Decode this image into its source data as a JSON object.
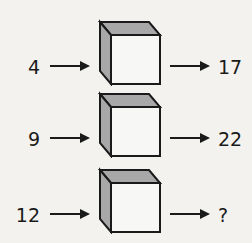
{
  "puzzle": {
    "rows": [
      {
        "input": "4",
        "output": "17"
      },
      {
        "input": "9",
        "output": "22"
      },
      {
        "input": "12",
        "output": "?"
      }
    ]
  },
  "colors": {
    "background": "#f3f2ef",
    "stroke": "#1a1a1a",
    "shade": "#a8a8a8",
    "face": "#f7f7f5"
  }
}
